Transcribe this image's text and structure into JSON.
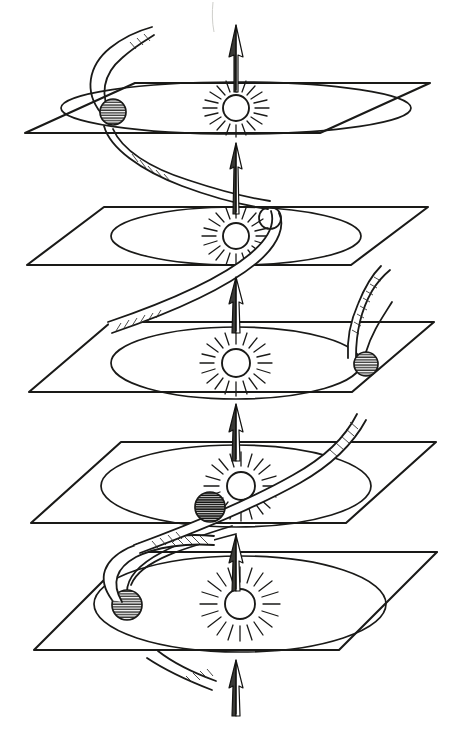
{
  "figure": {
    "caption": "",
    "background_color": "#ffffff",
    "ink_color": "#1a1a18",
    "width": 453,
    "height": 740,
    "style": "hand-drawn line engraving"
  },
  "legend": {
    "sun_label": "Sun",
    "earth_label": "Earth",
    "plane_label": "plane of the ecliptic",
    "arrow_label": "direction of solar motion",
    "helix_label": "helical path of the Earth"
  },
  "planes": [
    {
      "index": 0,
      "name": "ecliptic-plane-1",
      "order": "top",
      "top_edge_y": 83,
      "bottom_edge_y": 133,
      "left_x": 25,
      "right_x": 430,
      "skew": 64,
      "ellipse_rx": 175,
      "ellipse_ry": 26,
      "center_x": 236,
      "center_y": 108,
      "sun": {
        "cx": 236,
        "cy": 108,
        "r": 13,
        "rays": 20
      },
      "earth": {
        "cx": 113,
        "cy": 112,
        "r": 13,
        "shade": "light",
        "phase": "left"
      }
    },
    {
      "index": 1,
      "name": "ecliptic-plane-2",
      "order": "second",
      "top_edge_y": 207,
      "bottom_edge_y": 265,
      "left_x": 27,
      "right_x": 428,
      "skew": 72,
      "ellipse_rx": 125,
      "ellipse_ry": 29,
      "center_x": 236,
      "center_y": 236,
      "sun": {
        "cx": 236,
        "cy": 236,
        "r": 13,
        "rays": 20
      },
      "earth": {
        "cx": 270,
        "cy": 218,
        "r": 11,
        "shade": "white",
        "phase": "upper-right"
      }
    },
    {
      "index": 2,
      "name": "ecliptic-plane-3",
      "order": "third",
      "top_edge_y": 322,
      "bottom_edge_y": 392,
      "left_x": 29,
      "right_x": 434,
      "skew": 82,
      "ellipse_rx": 125,
      "ellipse_ry": 36,
      "center_x": 236,
      "center_y": 364,
      "sun": {
        "cx": 236,
        "cy": 363,
        "r": 14,
        "rays": 20
      },
      "earth": {
        "cx": 366,
        "cy": 364,
        "r": 12,
        "shade": "medium",
        "phase": "right"
      }
    },
    {
      "index": 3,
      "name": "ecliptic-plane-4",
      "order": "fourth",
      "top_edge_y": 442,
      "bottom_edge_y": 523,
      "left_x": 31,
      "right_x": 436,
      "skew": 90,
      "ellipse_rx": 135,
      "ellipse_ry": 41,
      "center_x": 236,
      "center_y": 486,
      "sun": {
        "cx": 241,
        "cy": 486,
        "r": 14,
        "rays": 20
      },
      "earth": {
        "cx": 210,
        "cy": 507,
        "r": 15,
        "shade": "dark",
        "phase": "front-left"
      }
    },
    {
      "index": 4,
      "name": "ecliptic-plane-5",
      "order": "bottom",
      "top_edge_y": 552,
      "bottom_edge_y": 650,
      "left_x": 34,
      "right_x": 437,
      "skew": 98,
      "ellipse_rx": 146,
      "ellipse_ry": 48,
      "center_x": 240,
      "center_y": 604,
      "sun": {
        "cx": 240,
        "cy": 604,
        "r": 15,
        "rays": 20
      },
      "earth": {
        "cx": 127,
        "cy": 605,
        "r": 15,
        "shade": "medium",
        "phase": "left"
      }
    }
  ],
  "axis_arrows": [
    {
      "name": "arrow-above-top-plane",
      "x": 236,
      "tip_y": 25,
      "tail_y": 90,
      "state": "above"
    },
    {
      "name": "arrow-between-1-2",
      "x": 236,
      "tip_y": 143,
      "tail_y": 215,
      "state": "between"
    },
    {
      "name": "arrow-between-2-3",
      "x": 236,
      "tip_y": 277,
      "tail_y": 334,
      "state": "between"
    },
    {
      "name": "arrow-between-3-4",
      "x": 236,
      "tip_y": 404,
      "tail_y": 462,
      "state": "between"
    },
    {
      "name": "arrow-between-4-5",
      "x": 236,
      "tip_y": 535,
      "tail_y": 592,
      "state": "between"
    },
    {
      "name": "arrow-below-bottom-plane",
      "x": 236,
      "tip_y": 660,
      "tail_y": 715,
      "state": "below"
    }
  ],
  "helix": {
    "name": "earth-helical-track",
    "description": "continuous ribbon connecting the Earth positions through the five planes",
    "turns": 4.5,
    "ribbon_width_max": 13,
    "ribbon_width_min": 3
  }
}
